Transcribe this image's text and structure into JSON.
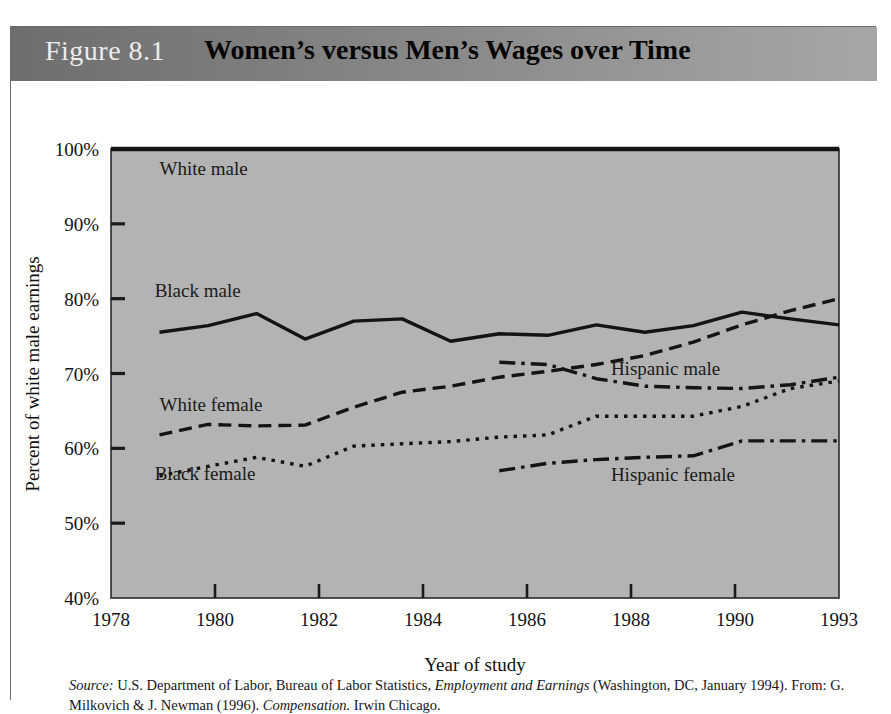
{
  "figure": {
    "number": "Figure 8.1",
    "title": "Women’s versus Men’s Wages over Time",
    "header_bg_left": "#6e6e6e",
    "header_bg_right": "#a6a6a6",
    "plot_bg": "#b3b3b3"
  },
  "source": {
    "label": "Source:",
    "text_part1": " U.S. Department of Labor, Bureau of Labor Statistics, ",
    "italic1": "Employment and Earnings",
    "text_part2": " (Washington, DC, January 1994). From: G. Milkovich & J. Newman (1996). ",
    "italic2": "Compensation.",
    "text_part3": " Irwin Chicago."
  },
  "chart_data": {
    "type": "line",
    "title": "Women’s versus Men’s Wages over Time",
    "xlabel": "Year of study",
    "ylabel": "Percent of white male earnings",
    "xlim": [
      1978,
      1993
    ],
    "ylim": [
      40,
      100
    ],
    "ytick_labels": [
      "100%",
      "90%",
      "80%",
      "70%",
      "60%",
      "50%",
      "40%"
    ],
    "ytick_values": [
      100,
      90,
      80,
      70,
      60,
      50,
      40
    ],
    "xtick_labels": [
      "1978",
      "1980",
      "1982",
      "1984",
      "1986",
      "1988",
      "1990",
      "1993"
    ],
    "xtick_values": [
      1978,
      1980,
      1982,
      1984,
      1986,
      1988,
      1990,
      1993
    ],
    "grid": false,
    "legend": "inline-labels",
    "series": [
      {
        "name": "White male",
        "style": "solid",
        "label_x": 1979.0,
        "label_y": 96.5,
        "x": [
          1978,
          1993
        ],
        "values": [
          100,
          100
        ]
      },
      {
        "name": "Black male",
        "style": "solid",
        "label_x": 1978.9,
        "label_y": 80.2,
        "x": [
          1979,
          1980,
          1981,
          1982,
          1983,
          1984,
          1985,
          1986,
          1987,
          1988,
          1989,
          1990,
          1991,
          1992,
          1993
        ],
        "values": [
          75.5,
          76.4,
          78.0,
          74.6,
          77.0,
          77.3,
          74.3,
          75.3,
          75.1,
          76.5,
          75.5,
          76.4,
          78.2,
          77.3,
          76.5
        ]
      },
      {
        "name": "White female",
        "style": "dashed",
        "label_x": 1979.0,
        "label_y": 65.0,
        "x": [
          1979,
          1980,
          1981,
          1982,
          1983,
          1984,
          1985,
          1986,
          1987,
          1988,
          1989,
          1990,
          1991,
          1992,
          1993
        ],
        "values": [
          61.8,
          63.2,
          63.0,
          63.1,
          65.5,
          67.5,
          68.3,
          69.5,
          70.3,
          71.2,
          72.4,
          74.2,
          76.5,
          78.4,
          80.0
        ]
      },
      {
        "name": "Black female",
        "style": "dotted",
        "label_x": 1978.9,
        "label_y": 55.8,
        "x": [
          1979,
          1980,
          1981,
          1982,
          1983,
          1984,
          1985,
          1986,
          1987,
          1988,
          1989,
          1990,
          1991,
          1992,
          1993
        ],
        "values": [
          56.3,
          57.6,
          58.8,
          57.6,
          60.3,
          60.6,
          60.9,
          61.5,
          61.8,
          64.3,
          64.3,
          64.3,
          65.6,
          68.0,
          69.0
        ]
      },
      {
        "name": "Hispanic male",
        "style": "dashdot",
        "label_x": 1988.3,
        "label_y": 69.8,
        "x": [
          1986,
          1987,
          1988,
          1989,
          1990,
          1991,
          1992,
          1993
        ],
        "values": [
          71.5,
          71.2,
          69.3,
          68.3,
          68.1,
          68.0,
          68.5,
          69.5
        ]
      },
      {
        "name": "Hispanic female",
        "style": "dashdot",
        "label_x": 1988.3,
        "label_y": 55.7,
        "x": [
          1986,
          1987,
          1988,
          1989,
          1990,
          1991,
          1992,
          1993
        ],
        "values": [
          57.0,
          58.0,
          58.5,
          58.8,
          59.0,
          61.0,
          61.0,
          61.0
        ]
      }
    ]
  }
}
